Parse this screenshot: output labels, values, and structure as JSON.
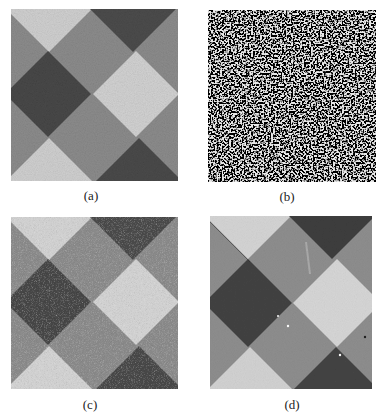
{
  "figure": {
    "panels": [
      {
        "id": "a",
        "label": "(a)",
        "description": "diagonal checkerboard, moderate noise"
      },
      {
        "id": "b",
        "label": "(b)",
        "description": "heavy salt-and-pepper style noise, pattern nearly invisible"
      },
      {
        "id": "c",
        "label": "(c)",
        "description": "diagonal checkerboard, grainy noise"
      },
      {
        "id": "d",
        "label": "(d)",
        "description": "restored diagonal checkerboard with small artifacts"
      }
    ],
    "colors": {
      "dark": "#4a4a4a",
      "medium": "#8a8a8a",
      "light": "#cfcfcf",
      "noise_bg": "#e6e6e6"
    }
  }
}
